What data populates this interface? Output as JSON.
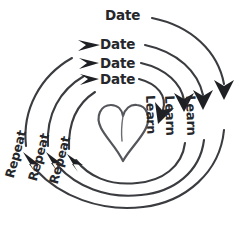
{
  "diagram": {
    "center_icon": "heart-icon",
    "stroke_color": "#3b3c40",
    "text_color": "#26272b",
    "background": "#ffffff",
    "labels": {
      "date": [
        "Date",
        "Date",
        "Date",
        "Date"
      ],
      "learn": [
        "Learn",
        "Learn",
        "Learn"
      ],
      "repeat": [
        "Repeat",
        "Repeat",
        "Repeat"
      ]
    }
  }
}
